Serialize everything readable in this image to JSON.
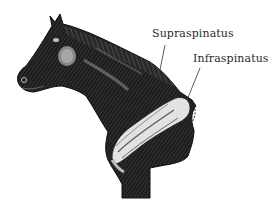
{
  "figure": {
    "labels": [
      {
        "id": "supraspinatus",
        "text": "Supraspinatus"
      },
      {
        "id": "infraspinatus",
        "text": "Infraspinatus"
      }
    ],
    "colors": {
      "background": "#ffffff",
      "ink": "#1a1a1a",
      "label_text": "#2a2a2a",
      "muscle_highlight": "#d8d8d8"
    }
  }
}
